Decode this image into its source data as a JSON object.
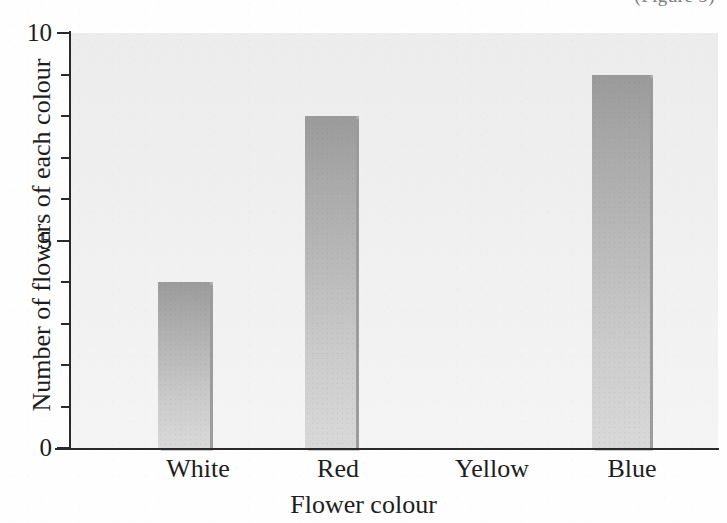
{
  "figure": {
    "caption_cut_off": "(Figure 5)",
    "width": 727,
    "height": 523
  },
  "chart_data": {
    "type": "bar",
    "title": "",
    "categories": [
      "White",
      "Red",
      "Yellow",
      "Blue"
    ],
    "values": [
      4,
      8,
      0,
      9
    ],
    "xlabel": "Flower colour",
    "ylabel": "Number of flowers of each colour",
    "ylim": [
      0,
      10
    ],
    "ytick_labels": [
      "0",
      "5",
      "10"
    ],
    "ytick_values": [
      0,
      5,
      10
    ],
    "yminor_ticks": [
      1,
      2,
      3,
      4,
      6,
      7,
      8,
      9
    ],
    "grid": false,
    "legend": false,
    "series": [
      {
        "name": "Number of flowers of each colour",
        "values": [
          4,
          8,
          0,
          9
        ]
      }
    ],
    "bar_color": "#b4b4b4",
    "plot_background": "#f0f0f0",
    "axis_color": "#2a2a2a"
  }
}
